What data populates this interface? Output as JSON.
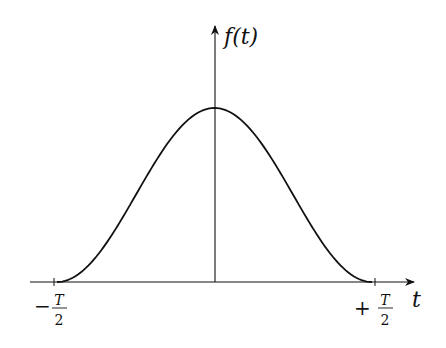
{
  "diagram": {
    "type": "function-plot",
    "y_axis_label": "f(t)",
    "x_axis_label": "t",
    "ticks": {
      "left": {
        "sign": "−",
        "numerator": "T",
        "denominator": "2"
      },
      "right": {
        "sign": "+",
        "numerator": "T",
        "denominator": "2"
      }
    },
    "colors": {
      "stroke": "#111111",
      "background": "#ffffff"
    }
  },
  "chart_data": {
    "type": "line",
    "title": "",
    "xlabel": "t",
    "ylabel": "f(t)",
    "x_ticks": [
      "-T/2",
      "+T/2"
    ],
    "series": [
      {
        "name": "f(t)",
        "x": [
          -0.5,
          -0.4,
          -0.3,
          -0.2,
          -0.1,
          0.0,
          0.1,
          0.2,
          0.3,
          0.4,
          0.5
        ],
        "values": [
          0.0,
          0.095,
          0.345,
          0.655,
          0.905,
          1.0,
          0.905,
          0.655,
          0.345,
          0.095,
          0.0
        ]
      }
    ],
    "grid": false,
    "legend": "none"
  }
}
